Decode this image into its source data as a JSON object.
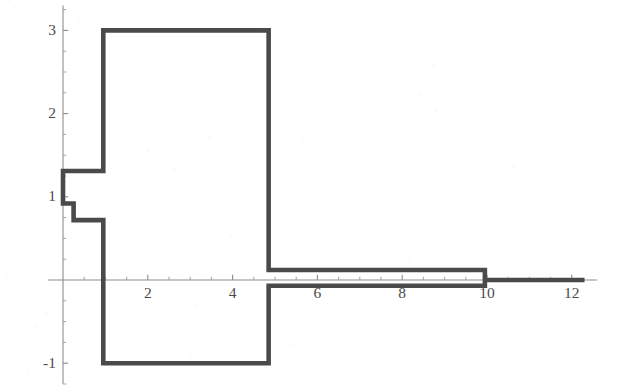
{
  "figure": {
    "title": "",
    "background_color": "#ffffff",
    "curve_color": "#4a4a4a",
    "axis_color": "#8d8d8d",
    "label_color": "#4b4b4b"
  },
  "axes": {
    "x": {
      "label": "",
      "range": [
        -0.35,
        12.6
      ],
      "tick_labels": [
        "2",
        "4",
        "6",
        "8",
        "10",
        "12"
      ],
      "tick_values": [
        2,
        4,
        6,
        8,
        10,
        12
      ],
      "minor_tick_step": 0.5,
      "axis_position_y": 0
    },
    "y": {
      "label": "",
      "range": [
        -1.25,
        3.3
      ],
      "tick_labels": [
        "3",
        "2",
        "1",
        "-1"
      ],
      "tick_values": [
        3,
        2,
        1,
        -1
      ],
      "minor_tick_step": 0.25,
      "axis_position_x": 0
    },
    "grid": "off",
    "legend": "none"
  },
  "chart_data": {
    "type": "line",
    "subtype": "step-function-envelope",
    "title": "",
    "xlabel": "",
    "ylabel": "",
    "xlim": [
      -0.35,
      12.6
    ],
    "ylim": [
      -1.25,
      3.3
    ],
    "grid": false,
    "legend_position": "none",
    "series": [
      {
        "name": "upper-envelope",
        "step_mode": "post",
        "x": [
          0.0,
          0.25,
          0.95,
          4.85,
          9.95,
          12.3
        ],
        "values": [
          1.31,
          1.31,
          3.0,
          0.12,
          0.0,
          0.0
        ],
        "segments": [
          {
            "x_start": 0.0,
            "x_end": 0.25,
            "y": 1.31
          },
          {
            "x_start": 0.25,
            "x_end": 0.95,
            "y": 1.31
          },
          {
            "x_start": 0.95,
            "x_end": 4.85,
            "y": 3.0
          },
          {
            "x_start": 4.85,
            "x_end": 9.95,
            "y": 0.12
          },
          {
            "x_start": 9.95,
            "x_end": 12.3,
            "y": 0.0
          }
        ]
      },
      {
        "name": "lower-envelope",
        "step_mode": "post",
        "x": [
          0.0,
          0.25,
          0.95,
          4.85,
          12.3
        ],
        "values": [
          0.92,
          0.72,
          -1.0,
          -0.07,
          0.0
        ],
        "segments": [
          {
            "x_start": 0.0,
            "x_end": 0.25,
            "y": 0.92
          },
          {
            "x_start": 0.25,
            "x_end": 0.95,
            "y": 0.72
          },
          {
            "x_start": 0.95,
            "x_end": 4.85,
            "y": -1.0
          },
          {
            "x_start": 4.85,
            "x_end": 9.95,
            "y": -0.07
          },
          {
            "x_start": 9.95,
            "x_end": 12.3,
            "y": 0.0
          }
        ]
      }
    ],
    "closed_outline_points": [
      [
        0.0,
        1.31
      ],
      [
        0.25,
        1.31
      ],
      [
        0.25,
        1.31
      ],
      [
        0.95,
        1.31
      ],
      [
        0.95,
        3.0
      ],
      [
        4.85,
        3.0
      ],
      [
        4.85,
        0.12
      ],
      [
        9.95,
        0.12
      ],
      [
        9.95,
        0.0
      ],
      [
        12.3,
        0.0
      ],
      [
        12.3,
        0.0
      ],
      [
        9.95,
        0.0
      ],
      [
        9.95,
        -0.07
      ],
      [
        4.85,
        -0.07
      ],
      [
        4.85,
        -1.0
      ],
      [
        0.95,
        -1.0
      ],
      [
        0.95,
        0.72
      ],
      [
        0.25,
        0.72
      ],
      [
        0.25,
        0.92
      ],
      [
        0.0,
        0.92
      ]
    ]
  }
}
